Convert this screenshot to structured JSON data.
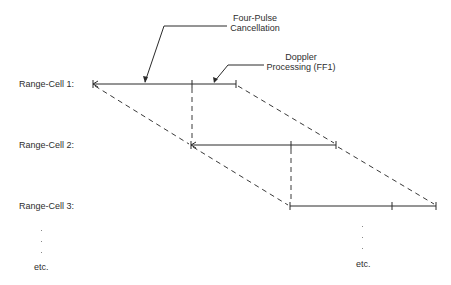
{
  "diagram": {
    "callouts": {
      "four_pulse": {
        "line1": "Four-Pulse",
        "line2": "Cancellation"
      },
      "doppler": {
        "line1": "Doppler",
        "line2": "Processing (FF1)"
      }
    },
    "rows": [
      {
        "label": "Range-Cell 1:"
      },
      {
        "label": "Range-Cell 2:"
      },
      {
        "label": "Range-Cell 3:"
      }
    ],
    "continuation": {
      "left_label": "etc.",
      "right_label": "etc."
    },
    "colors": {
      "line": "#2a2a2a",
      "dashed": "#3a3a3a",
      "text": "#2e2e2e"
    }
  }
}
